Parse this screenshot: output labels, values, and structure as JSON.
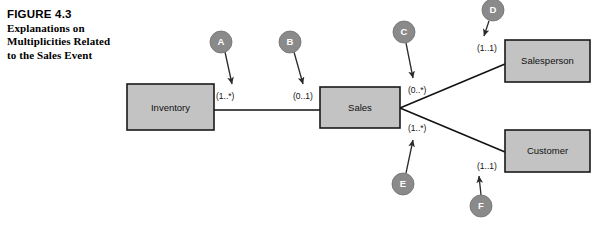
{
  "figure": {
    "number_label": "FIGURE 4.3",
    "caption_lines": [
      "Explanations on",
      "Multiplicities Related",
      "to the Sales Event"
    ]
  },
  "colors": {
    "entity_fill": "#c3c3c3",
    "entity_stroke": "#1a1a1a",
    "callout_fill": "#8a8a8a",
    "callout_text": "#ffffff",
    "line": "#111111",
    "background": "#ffffff"
  },
  "entities": [
    {
      "id": "inventory",
      "label": "Inventory",
      "x": 127,
      "y": 84,
      "w": 87,
      "h": 46
    },
    {
      "id": "sales",
      "label": "Sales",
      "x": 320,
      "y": 87,
      "w": 80,
      "h": 41
    },
    {
      "id": "salesperson",
      "label": "Salesperson",
      "x": 505,
      "y": 40,
      "w": 85,
      "h": 42
    },
    {
      "id": "customer",
      "label": "Customer",
      "x": 505,
      "y": 130,
      "w": 85,
      "h": 42
    }
  ],
  "multiplicities": [
    {
      "id": "mult-a",
      "text": "(1..*)",
      "x": 216,
      "y": 99,
      "relates": "inventory-to-sales-near-inventory"
    },
    {
      "id": "mult-b",
      "text": "(0..1)",
      "x": 293,
      "y": 99,
      "relates": "inventory-to-sales-near-sales"
    },
    {
      "id": "mult-c",
      "text": "(0..*)",
      "x": 408,
      "y": 93,
      "relates": "sales-to-salesperson-near-sales"
    },
    {
      "id": "mult-d",
      "text": "(1..1)",
      "x": 477,
      "y": 51,
      "relates": "sales-to-salesperson-near-salesperson"
    },
    {
      "id": "mult-e",
      "text": "(1..*)",
      "x": 408,
      "y": 131,
      "relates": "sales-to-customer-near-sales"
    },
    {
      "id": "mult-f",
      "text": "(1..1)",
      "x": 477,
      "y": 169,
      "relates": "sales-to-customer-near-customer"
    }
  ],
  "callouts": [
    {
      "id": "callout-a",
      "letter": "A",
      "cx": 221,
      "cy": 42,
      "r": 11,
      "tip_x": 232,
      "tip_y": 86,
      "label_target": "mult-a"
    },
    {
      "id": "callout-b",
      "letter": "B",
      "cx": 290,
      "cy": 42,
      "r": 11,
      "tip_x": 303,
      "tip_y": 86,
      "label_target": "mult-b"
    },
    {
      "id": "callout-c",
      "letter": "C",
      "cx": 404,
      "cy": 32,
      "r": 11,
      "tip_x": 414,
      "tip_y": 79,
      "label_target": "mult-c"
    },
    {
      "id": "callout-d",
      "letter": "D",
      "cx": 493,
      "cy": 10,
      "r": 11,
      "tip_x": 484,
      "tip_y": 35,
      "label_target": "mult-d"
    },
    {
      "id": "callout-e",
      "letter": "E",
      "cx": 403,
      "cy": 184,
      "r": 11,
      "tip_x": 413,
      "tip_y": 139,
      "label_target": "mult-e"
    },
    {
      "id": "callout-f",
      "letter": "F",
      "cx": 481,
      "cy": 206,
      "r": 11,
      "tip_x": 479,
      "tip_y": 176,
      "label_target": "mult-f"
    }
  ],
  "relations": [
    {
      "id": "rel-inventory-sales",
      "from": "inventory",
      "to": "sales",
      "path": "M 214 110 L 320 110"
    },
    {
      "id": "rel-sales-salesperson",
      "from": "sales",
      "to": "salesperson",
      "path": "M 400 108 L 505 64"
    },
    {
      "id": "rel-sales-customer",
      "from": "sales",
      "to": "customer",
      "path": "M 400 108 L 505 152"
    }
  ]
}
